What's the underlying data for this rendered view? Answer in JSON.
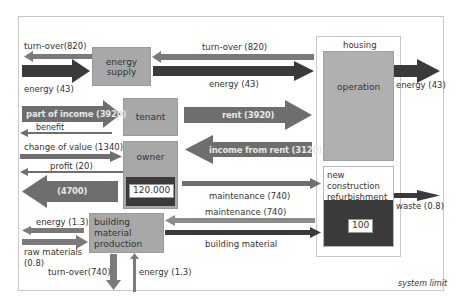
{
  "frame": {
    "label": "system limit"
  },
  "nodes": {
    "energy_supply": {
      "label": "energy supply"
    },
    "tenant": {
      "label": "tenant"
    },
    "owner": {
      "label": "owner",
      "value": "120.000"
    },
    "building_material_production": {
      "label": "building material production"
    },
    "housing": {
      "label": "housing",
      "operation": {
        "label": "operation"
      },
      "construction": {
        "lines": [
          "new construction",
          "refurbishment",
          "demolition"
        ],
        "value": "100"
      }
    }
  },
  "flows": {
    "turnover_left_in": {
      "label": "turn-over(820)"
    },
    "energy_left_in": {
      "label": "energy (43)"
    },
    "turnover_top": {
      "label": "turn-over (820)"
    },
    "energy_top": {
      "label": "energy (43)"
    },
    "energy_out_right": {
      "label": "energy (43)"
    },
    "part_of_income": {
      "label": "part of income (3920)"
    },
    "benefit": {
      "label": "benefit"
    },
    "rent": {
      "label": "rent (3920)"
    },
    "income_from_rent": {
      "label": "income from rent (3120)"
    },
    "change_of_value": {
      "label": "change of value (1340)"
    },
    "profit": {
      "label": "profit (20)"
    },
    "big_out": {
      "label": "(4700)"
    },
    "maintenance_owner": {
      "label": "maintenance (740)"
    },
    "maintenance_back": {
      "label": "maintenance (740)"
    },
    "building_material": {
      "label": "building material"
    },
    "waste": {
      "label": "waste (0.8)"
    },
    "energy_bmp": {
      "label": "energy (1.3)"
    },
    "raw_materials": {
      "label": "raw materials",
      "value": "(0.8)"
    },
    "turnover_bottom": {
      "label": "turn-over(740)"
    },
    "energy_bottom": {
      "label": "energy (1.3)"
    }
  },
  "colors": {
    "dark_arrow": "#3a3a3a",
    "mid_arrow": "#6e6e6e",
    "light_arrow": "#8c8c8c",
    "box_fill": "#a8a8a8"
  }
}
